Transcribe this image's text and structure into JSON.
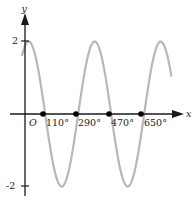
{
  "chart_data": {
    "type": "line",
    "title": "",
    "function": "y = 2cos(x - 20°)",
    "xlabel": "x",
    "ylabel": "y",
    "origin_label": "O",
    "x_tick_labels": [
      "110°",
      "290°",
      "470°",
      "650°"
    ],
    "x_ticks": [
      110,
      290,
      470,
      650
    ],
    "y_tick_labels": [
      "2",
      "-2"
    ],
    "y_ticks": [
      2,
      -2
    ],
    "marked_points": [
      {
        "x": 110,
        "y": 0
      },
      {
        "x": 290,
        "y": 0
      },
      {
        "x": 470,
        "y": 0
      },
      {
        "x": 650,
        "y": 0
      }
    ],
    "xlim": [
      -15,
      830
    ],
    "ylim": [
      -2,
      2
    ],
    "amplitude": 2,
    "phase_shift_deg": 20,
    "period_deg": 360,
    "grid": false,
    "colors": {
      "curve": "#b8b8b8",
      "axes": "#1a1a1a",
      "points": "#000000"
    }
  }
}
